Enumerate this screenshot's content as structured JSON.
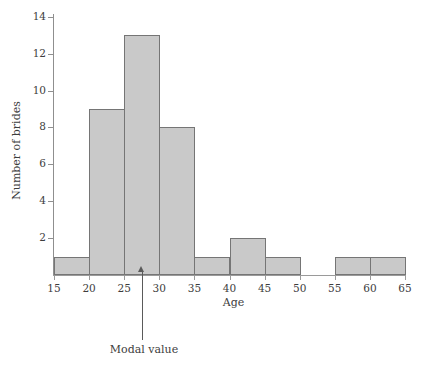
{
  "chart_data": {
    "type": "bar",
    "title": "",
    "subtitle": "",
    "xlabel": "Age",
    "ylabel": "Number of brides",
    "xlim": [
      15,
      65
    ],
    "ylim": [
      0,
      14
    ],
    "grid": false,
    "legend": null,
    "bin_width": 5,
    "bin_edges": [
      15,
      20,
      25,
      30,
      35,
      40,
      45,
      50,
      55,
      60,
      65
    ],
    "categories": [
      "15-20",
      "20-25",
      "25-30",
      "30-35",
      "35-40",
      "40-45",
      "45-50",
      "50-55",
      "55-60",
      "60-65"
    ],
    "values": [
      1,
      9,
      13,
      8,
      1,
      2,
      1,
      0,
      1,
      1
    ],
    "x_tick_labels": [
      "15",
      "20",
      "25",
      "30",
      "35",
      "40",
      "45",
      "50",
      "55",
      "60",
      "65"
    ],
    "y_tick_labels": [
      "2",
      "4",
      "6",
      "8",
      "10",
      "12",
      "14"
    ],
    "y_tick_values": [
      2,
      4,
      6,
      8,
      10,
      12,
      14
    ],
    "annotations": [
      {
        "label": "Modal value",
        "target_x": 27.5,
        "kind": "arrow-up"
      }
    ],
    "colors": {
      "bar_fill": "#c9c9c9",
      "bar_border": "#757575",
      "axis": "#9a9a9a",
      "text": "#3d3d3d",
      "annotation": "#5a5a5a",
      "background": "#ffffff"
    }
  }
}
